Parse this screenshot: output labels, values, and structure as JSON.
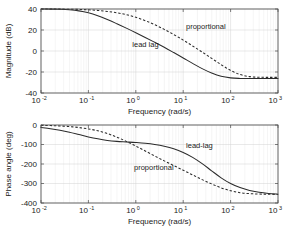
{
  "figure": {
    "title": "",
    "background": "#ffffff",
    "line_color": "#2b2b2b",
    "grid_color": "#d2d2d2"
  },
  "chart_data": [
    {
      "type": "line",
      "name": "magnitude-bode-plot",
      "title": "",
      "xlabel": "Frequency (rad/s)",
      "ylabel": "Magnitude (dB)",
      "xscale": "log",
      "xlim": [
        0.01,
        1000
      ],
      "ylim": [
        -40,
        40
      ],
      "yticks": [
        -40,
        -20,
        0,
        20,
        40
      ],
      "yticklabels": [
        "-40",
        "-20",
        "0",
        "20",
        "40"
      ],
      "xticks": [
        0.01,
        0.1,
        1,
        10,
        100,
        1000
      ],
      "xticklabels": [
        "10",
        "10",
        "10",
        "10",
        "10",
        "10"
      ],
      "xtickexponents": [
        "-2",
        "-1",
        "0",
        "1",
        "2",
        "3"
      ],
      "grid": true,
      "legend": "none",
      "annotations": [
        {
          "text": "proportional",
          "x": 30,
          "y": 21
        },
        {
          "text": "lead  lag",
          "x": 1.6,
          "y": 4
        }
      ],
      "series": [
        {
          "name": "lead lag",
          "style": "solid",
          "x": [
            0.01,
            0.0158,
            0.0251,
            0.0398,
            0.0631,
            0.1,
            0.158,
            0.251,
            0.398,
            0.631,
            1.0,
            1.58,
            2.51,
            3.98,
            6.31,
            10.0,
            15.8,
            25.1,
            39.8,
            63.1,
            100.0,
            158.0,
            251.0,
            398.0,
            631.0,
            1000.0
          ],
          "y": [
            40.0,
            39.9,
            39.7,
            39.2,
            38.2,
            36.4,
            33.6,
            30.0,
            26.0,
            21.8,
            17.4,
            12.9,
            8.3,
            3.5,
            -1.5,
            -6.6,
            -11.8,
            -16.8,
            -21.0,
            -24.1,
            -25.6,
            -26.1,
            -26.2,
            -26.2,
            -26.2,
            -26.2
          ]
        },
        {
          "name": "proportional",
          "style": "dashed",
          "x": [
            0.01,
            0.0158,
            0.0251,
            0.0398,
            0.0631,
            0.1,
            0.158,
            0.251,
            0.398,
            0.631,
            1.0,
            1.58,
            2.51,
            3.98,
            6.31,
            10.0,
            15.8,
            25.1,
            39.8,
            63.1,
            100.0,
            158.0,
            251.0,
            398.0,
            631.0,
            1000.0
          ],
          "y": [
            40.0,
            40.0,
            39.9,
            39.8,
            39.6,
            39.2,
            38.6,
            37.7,
            36.4,
            34.6,
            32.1,
            28.9,
            25.0,
            20.6,
            15.7,
            10.4,
            4.8,
            -1.0,
            -7.0,
            -13.0,
            -18.5,
            -22.4,
            -24.4,
            -25.0,
            -25.1,
            -25.1
          ]
        }
      ]
    },
    {
      "type": "line",
      "name": "phase-bode-plot",
      "title": "",
      "xlabel": "Frequency (rad/s)",
      "ylabel": "Phase angle (deg)",
      "xscale": "log",
      "xlim": [
        0.01,
        1000
      ],
      "ylim": [
        -400,
        0
      ],
      "yticks": [
        -400,
        -300,
        -200,
        -100,
        0
      ],
      "yticklabels": [
        "-400",
        "-300",
        "-200",
        "-100",
        "0"
      ],
      "xticks": [
        0.01,
        0.1,
        1,
        10,
        100,
        1000
      ],
      "xticklabels": [
        "10",
        "10",
        "10",
        "10",
        "10",
        "10"
      ],
      "xtickexponents": [
        "-2",
        "-1",
        "0",
        "1",
        "2",
        "3"
      ],
      "grid": true,
      "legend": "none",
      "annotations": [
        {
          "text": "lead-lag",
          "x": 22,
          "y": -118
        },
        {
          "text": "proportional",
          "x": 2.4,
          "y": -232
        }
      ],
      "series": [
        {
          "name": "lead-lag",
          "style": "solid",
          "x": [
            0.01,
            0.0158,
            0.0251,
            0.0398,
            0.0631,
            0.1,
            0.158,
            0.251,
            0.398,
            0.631,
            1.0,
            1.58,
            2.51,
            3.98,
            6.31,
            10.0,
            15.8,
            25.1,
            39.8,
            63.1,
            100.0,
            158.0,
            251.0,
            398.0,
            631.0,
            1000.0
          ],
          "y": [
            -13.0,
            -19.0,
            -27.0,
            -37.0,
            -49.0,
            -61.0,
            -71.0,
            -79.0,
            -84.0,
            -87.0,
            -90.0,
            -94.0,
            -100.0,
            -109.0,
            -122.0,
            -141.0,
            -166.0,
            -198.0,
            -235.0,
            -271.0,
            -300.0,
            -321.0,
            -336.0,
            -345.0,
            -351.0,
            -355.0
          ]
        },
        {
          "name": "proportional",
          "style": "dashed",
          "x": [
            0.01,
            0.0158,
            0.0251,
            0.0398,
            0.0631,
            0.1,
            0.158,
            0.251,
            0.398,
            0.631,
            1.0,
            1.58,
            2.51,
            3.98,
            6.31,
            10.0,
            15.8,
            25.1,
            39.8,
            63.1,
            100.0,
            158.0,
            251.0,
            398.0,
            631.0,
            1000.0
          ],
          "y": [
            -2.0,
            -3.0,
            -5.0,
            -8.0,
            -13.0,
            -20.0,
            -30.0,
            -44.0,
            -62.0,
            -84.0,
            -108.0,
            -133.0,
            -159.0,
            -184.0,
            -208.0,
            -232.0,
            -256.0,
            -280.0,
            -302.0,
            -322.0,
            -337.0,
            -347.0,
            -352.0,
            -354.0,
            -355.0,
            -356.0
          ]
        }
      ]
    }
  ]
}
